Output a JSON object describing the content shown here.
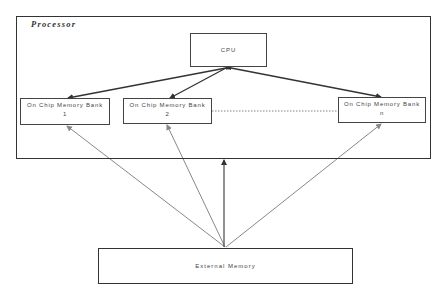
{
  "diagram": {
    "processor": {
      "label": "Processor"
    },
    "cpu": {
      "label": "CPU"
    },
    "banks": [
      {
        "line1": "On Chip Memory Bank",
        "line2": "1"
      },
      {
        "line1": "On Chip Memory Bank",
        "line2": "2"
      },
      {
        "line1": "On Chip Memory Bank",
        "line2": "n"
      }
    ],
    "external_memory": {
      "label": "External Memory"
    },
    "connections": [
      {
        "from": "CPU",
        "to": "On Chip Memory Bank 1",
        "style": "solid",
        "color": "#333333",
        "bidirectional": true
      },
      {
        "from": "CPU",
        "to": "On Chip Memory Bank 2",
        "style": "solid",
        "color": "#333333",
        "bidirectional": true
      },
      {
        "from": "CPU",
        "to": "On Chip Memory Bank n",
        "style": "solid",
        "color": "#333333",
        "bidirectional": true
      },
      {
        "from": "On Chip Memory Bank 2",
        "to": "On Chip Memory Bank n",
        "style": "dotted",
        "color": "#555555"
      },
      {
        "from": "External Memory",
        "to": "On Chip Memory Bank 1",
        "style": "solid",
        "color": "#888888"
      },
      {
        "from": "External Memory",
        "to": "On Chip Memory Bank 2",
        "style": "solid",
        "color": "#888888"
      },
      {
        "from": "External Memory",
        "to": "Processor",
        "style": "solid",
        "color": "#555555"
      },
      {
        "from": "External Memory",
        "to": "On Chip Memory Bank n",
        "style": "solid",
        "color": "#888888"
      }
    ]
  }
}
